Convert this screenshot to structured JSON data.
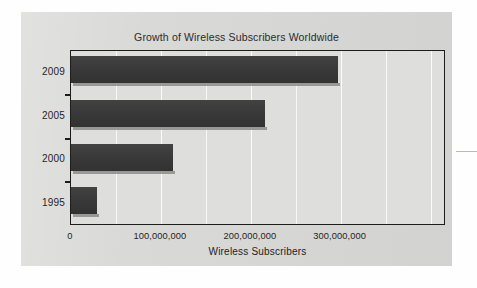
{
  "chart_data": {
    "type": "bar",
    "orientation": "horizontal",
    "title": "Growth of Wireless Subscribers Worldwide",
    "xlabel": "Wireless Subscribers",
    "ylabel": "",
    "categories": [
      "2009",
      "2005",
      "2000",
      "1995"
    ],
    "values": [
      297000000,
      216000000,
      113000000,
      29000000
    ],
    "series": [
      {
        "name": "Wireless Subscribers",
        "values": [
          297000000,
          216000000,
          113000000,
          29000000
        ]
      }
    ],
    "xlim": [
      0,
      415000000
    ],
    "ylim": null,
    "xticks": [
      0,
      100000000,
      200000000,
      300000000
    ],
    "xticklabels": [
      "0",
      "100,000,000",
      "200,000,000",
      "300,000,000"
    ],
    "gridlines": {
      "vertical": true,
      "horizontal": false,
      "minor_interval": 50000000
    },
    "legend": null,
    "legend_position": "none",
    "bar_color": "#3b3b3b",
    "panel_color": "#d9d9d7",
    "grid_color": "#ffffff",
    "axis_color": "#1d1d1d"
  },
  "figure": {
    "title": "Growth of Wireless Subscribers Worldwide",
    "axis_title_x": "Wireless Subscribers",
    "y_categories": [
      {
        "label": "2009"
      },
      {
        "label": "2005"
      },
      {
        "label": "2000"
      },
      {
        "label": "1995"
      }
    ],
    "x_tick_labels": [
      {
        "label": "0"
      },
      {
        "label": "100,000,000"
      },
      {
        "label": "200,000,000"
      },
      {
        "label": "300,000,000"
      }
    ]
  }
}
